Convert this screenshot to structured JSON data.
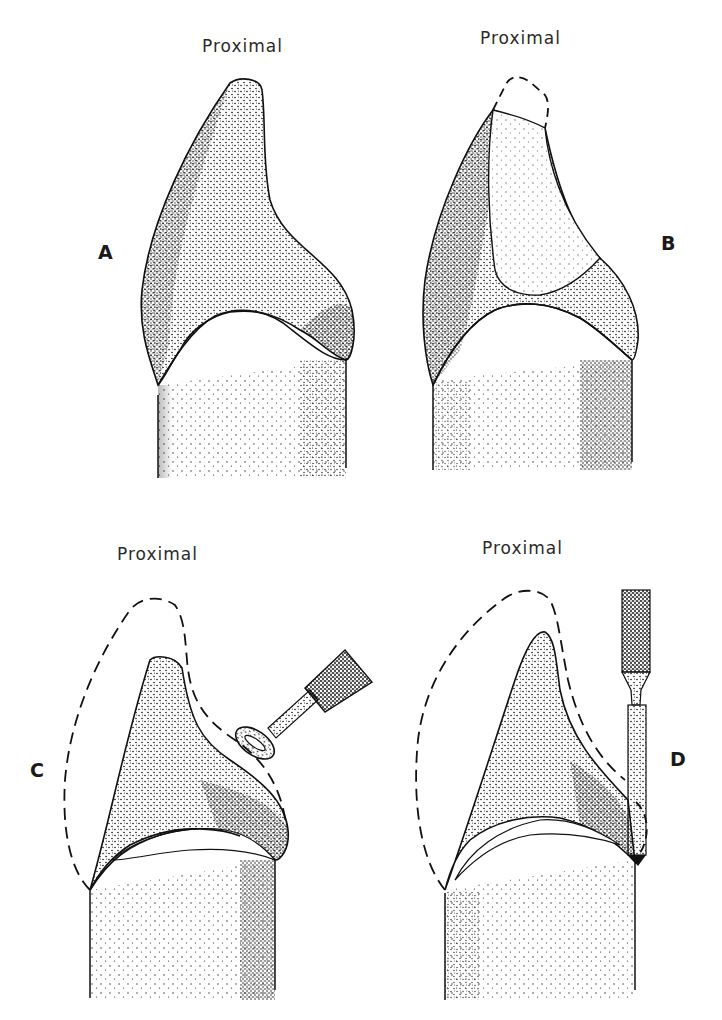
{
  "figure": {
    "panels": [
      {
        "id": "A",
        "letter": "A",
        "heading": "Proximal"
      },
      {
        "id": "B",
        "letter": "B",
        "heading": "Proximal"
      },
      {
        "id": "C",
        "letter": "C",
        "heading": "Proximal"
      },
      {
        "id": "D",
        "letter": "D",
        "heading": "Proximal"
      }
    ],
    "colors": {
      "ink": "#1a1a1a",
      "paper": "#ffffff"
    }
  }
}
